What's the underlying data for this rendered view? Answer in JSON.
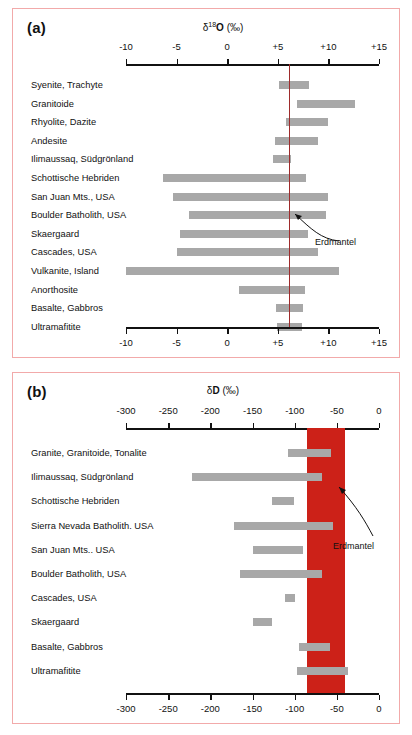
{
  "figure": {
    "frame_color": "#f2aaaa",
    "bar_color": "#a8a8a8",
    "mantle_color_a": "#9e2b2b",
    "mantle_color_b": "#cc2118"
  },
  "panel_a": {
    "letter": "(a)",
    "annotation": "Erdmantel"
  },
  "panel_b": {
    "letter": "(b)",
    "annotation": "Erdmantel"
  },
  "chart_data": [
    {
      "type": "bar",
      "orientation": "horizontal",
      "title": "δ18O (‰)",
      "title_html": "δ<sup>18</sup>O (‰)",
      "panel": "(a)",
      "xlabel": "δ18O (‰)",
      "ylabel": "",
      "xlim": [
        -10,
        15
      ],
      "ticks": [
        -10,
        -5,
        0,
        5,
        10,
        15
      ],
      "tick_labels": [
        "-10",
        "-5",
        "0",
        "+5",
        "+10",
        "+15"
      ],
      "grid": false,
      "axis_top": true,
      "axis_bottom": true,
      "reference_line": {
        "label": "Erdmantel",
        "value": 6.1
      },
      "categories": [
        "Syenite, Trachyte",
        "Granitoide",
        "Rhyolite, Dazite",
        "Andesite",
        "Ilimaussaq, Südgrönland",
        "Schottische Hebriden",
        "San Juan Mts., USA",
        "Boulder Batholith, USA",
        "Skaergaard",
        "Cascades, USA",
        "Vulkanite, Island",
        "Anorthosite",
        "Basalte, Gabbros",
        "Ultramafitite"
      ],
      "ranges": [
        [
          5.1,
          8.1
        ],
        [
          6.9,
          12.6
        ],
        [
          5.8,
          10.0
        ],
        [
          4.7,
          9.0
        ],
        [
          4.5,
          6.3
        ],
        [
          -6.3,
          7.8
        ],
        [
          -5.4,
          10.0
        ],
        [
          -3.8,
          9.8
        ],
        [
          -4.7,
          8.0
        ],
        [
          -5.0,
          9.0
        ],
        [
          -10.0,
          11.0
        ],
        [
          1.2,
          7.7
        ],
        [
          4.8,
          7.5
        ],
        [
          4.9,
          7.4
        ]
      ]
    },
    {
      "type": "bar",
      "orientation": "horizontal",
      "title": "δD (‰)",
      "title_html": "δD (‰)",
      "panel": "(b)",
      "xlabel": "δD (‰)",
      "ylabel": "",
      "xlim": [
        -300,
        0
      ],
      "ticks": [
        -300,
        -250,
        -200,
        -150,
        -100,
        -50,
        0
      ],
      "tick_labels": [
        "-300",
        "-250",
        "-200",
        "-150",
        "-100",
        "-50",
        "0"
      ],
      "grid": false,
      "axis_top": true,
      "axis_bottom": true,
      "reference_band": {
        "label": "Erdmantel",
        "range": [
          -85,
          -40
        ]
      },
      "categories": [
        "Granite, Granitoide, Tonalite",
        "Ilimaussaq, Südgrönland",
        "Schottische Hebriden",
        "Sierra Nevada Batholith. USA",
        "San Juan Mts.. USA",
        "Boulder Batholith, USA",
        "Cascades, USA",
        "Skaergaard",
        "Basalte, Gabbros",
        "Ultramafitite"
      ],
      "ranges": [
        [
          -108,
          -57
        ],
        [
          -222,
          -68
        ],
        [
          -127,
          -101
        ],
        [
          -172,
          -55
        ],
        [
          -150,
          -90
        ],
        [
          -165,
          -68
        ],
        [
          -111,
          -99
        ],
        [
          -150,
          -127
        ],
        [
          -95,
          -58
        ],
        [
          -97,
          -37
        ]
      ]
    }
  ]
}
